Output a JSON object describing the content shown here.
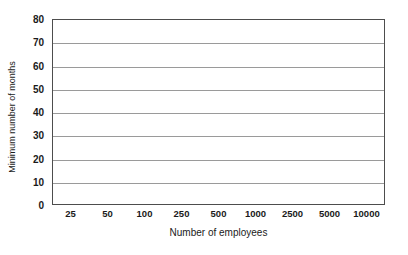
{
  "chart_data": {
    "type": "line",
    "title": "",
    "xlabel": "Number of employees",
    "ylabel": "Minimum number of months",
    "categories": [
      "25",
      "50",
      "100",
      "250",
      "500",
      "1000",
      "2500",
      "5000",
      "10000"
    ],
    "values": [
      67,
      33,
      17.5,
      7,
      3.5,
      2,
      1.5,
      1.5,
      1
    ],
    "series": [
      {
        "name": "Minimum number of months",
        "values": [
          67,
          33,
          17.5,
          7,
          3.5,
          2,
          1.5,
          1.5,
          1
        ]
      }
    ],
    "ylim": [
      0,
      80
    ],
    "y_ticks": [
      "0",
      "10",
      "20",
      "30",
      "40",
      "50",
      "60",
      "70",
      "80"
    ],
    "y_tick_values": [
      0,
      10,
      20,
      30,
      40,
      50,
      60,
      70,
      80
    ],
    "grid": "horizontal",
    "legend": "none",
    "marker": "square",
    "line_color": "#1a1a1a",
    "gridline_color": "#9a9a9a",
    "axis_color": "#4d4d4d",
    "background_color": "#ffffff"
  }
}
